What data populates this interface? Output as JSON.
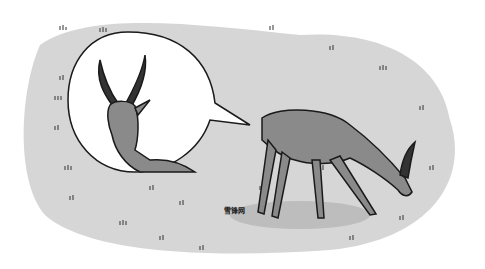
{
  "scene": {
    "description": "Illustration of a gazelle grazing on grassland with a thought bubble showing its head with long curved horns",
    "watermark": "雪锋网",
    "colors": {
      "ground": "#d6d6d6",
      "shadow": "#bdbdbd",
      "body": "#8a8a8a",
      "outline": "#1a1a1a",
      "bubble": "#ffffff"
    }
  }
}
